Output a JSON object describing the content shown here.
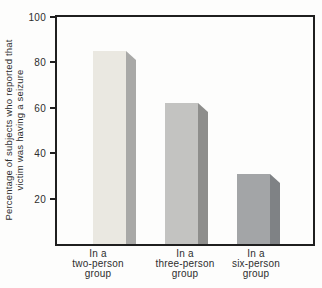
{
  "chart_data": {
    "type": "bar",
    "title": "",
    "categories": [
      [
        "In a",
        "two-person",
        "group"
      ],
      [
        "In a",
        "three-person",
        "group"
      ],
      [
        "In a",
        "six-person",
        "group"
      ]
    ],
    "values": [
      85,
      62,
      31
    ],
    "ylabel": [
      "Percentage of subjects who reported that",
      "victim was having a seizure"
    ],
    "xlabel": "",
    "ylim": [
      0,
      100
    ],
    "yticks": [
      100,
      80,
      60,
      40,
      20
    ],
    "grid": false,
    "legend": false,
    "bar_styles": [
      {
        "front": "#eae8e1",
        "side": "#a9a9a7"
      },
      {
        "front": "#c3c3c1",
        "side": "#8e8e8c"
      },
      {
        "front": "#a3a5a7",
        "side": "#7f8285"
      }
    ],
    "axis_color": "#1f1f1f",
    "text_color": "#2e2e2e",
    "background": "#fdfdfc"
  }
}
